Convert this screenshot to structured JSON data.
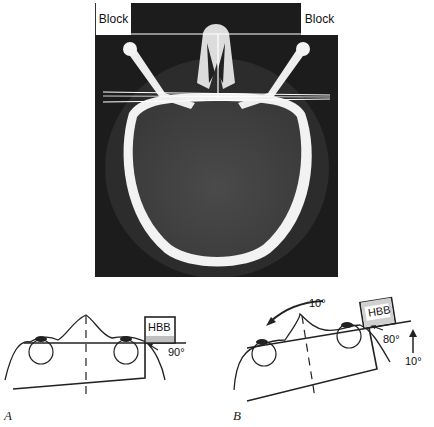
{
  "figure": {
    "ct_image": {
      "description": "Axial CT slice of skull at orbit level",
      "block_left_label": "Block",
      "block_right_label": "Block"
    },
    "panel_a": {
      "letter": "A",
      "box_label": "HBB",
      "angle_label": "90°"
    },
    "panel_b": {
      "letter": "B",
      "box_label": "HBB",
      "rotation_label": "10°",
      "angle_label": "80°",
      "tilt_label": "10°"
    }
  }
}
